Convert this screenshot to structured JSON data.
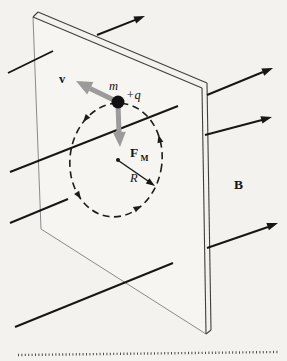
{
  "figure": {
    "type": "physics-diagram",
    "labels": {
      "velocity": "v",
      "mass": "m",
      "charge": "+q",
      "force_main": "F",
      "force_sub": "M",
      "radius": "R",
      "field": "B"
    },
    "colors": {
      "background": "#f3f2ee",
      "ink": "#161616",
      "vector_gray": "#9b9b9b",
      "plane_edge_dark": "#3f3f3f",
      "plane_edge_light": "#8a8a8a"
    },
    "motion_direction": "counterclockwise",
    "field_line_count": 4
  }
}
